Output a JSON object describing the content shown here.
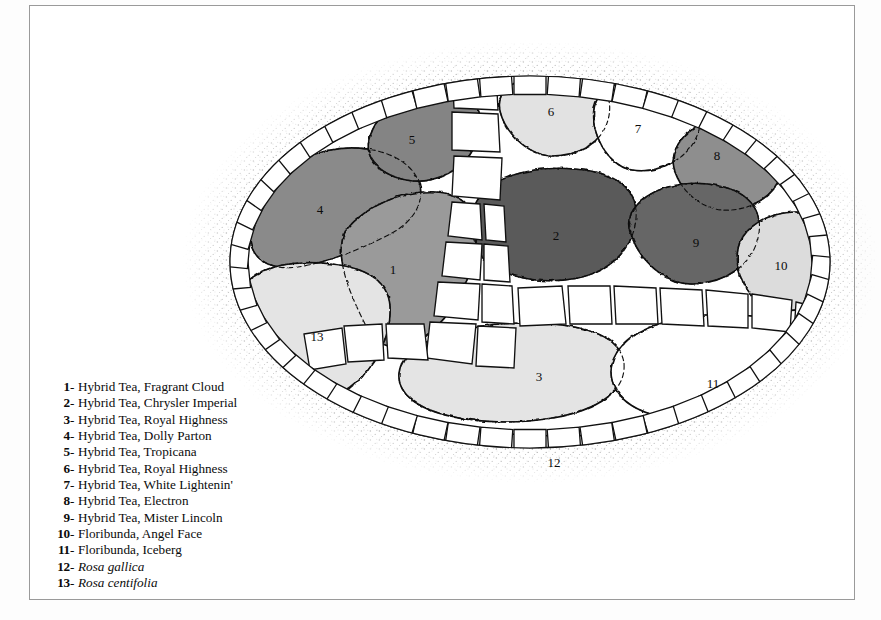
{
  "figure": {
    "kind": "garden-planting-plan",
    "shape": "oval bed with stone edging and flagstone path",
    "frame_color": "#9a9a9a",
    "background": "#ffffff"
  },
  "legend": {
    "name": "plant-key",
    "items": [
      {
        "num": "1",
        "dash": "-",
        "name": "Hybrid Tea, Fragrant Cloud",
        "italic": false,
        "fill": "#9a9a9a"
      },
      {
        "num": "2",
        "dash": "-",
        "name": "Hybrid Tea, Chrysler Imperial",
        "italic": false,
        "fill": "#5a5a5a"
      },
      {
        "num": "3",
        "dash": "-",
        "name": "Hybrid Tea, Royal Highness",
        "italic": false,
        "fill": "#e4e4e4"
      },
      {
        "num": "4",
        "dash": "-",
        "name": "Hybrid Tea, Dolly Parton",
        "italic": false,
        "fill": "#8a8a8a"
      },
      {
        "num": "5",
        "dash": "-",
        "name": "Hybrid Tea, Tropicana",
        "italic": false,
        "fill": "#848484"
      },
      {
        "num": "6",
        "dash": "-",
        "name": "Hybrid Tea, Royal Highness",
        "italic": false,
        "fill": "#e2e2e2"
      },
      {
        "num": "7",
        "dash": "-",
        "name": "Hybrid Tea, White Lightenin'",
        "italic": false,
        "fill": "#ffffff"
      },
      {
        "num": "8",
        "dash": "-",
        "name": "Hybrid Tea, Electron",
        "italic": false,
        "fill": "#8e8e8e"
      },
      {
        "num": "9",
        "dash": "-",
        "name": "Hybrid Tea, Mister Lincoln",
        "italic": false,
        "fill": "#666666"
      },
      {
        "num": "10",
        "dash": "-",
        "name": "Floribunda, Angel Face",
        "italic": false,
        "fill": "#dcdcdc"
      },
      {
        "num": "11",
        "dash": "-",
        "name": "Floribunda, Iceberg",
        "italic": false,
        "fill": "#ffffff"
      },
      {
        "num": "12",
        "dash": "-",
        "name": "Rosa gallica",
        "italic": true,
        "fill": "#e0e0e0"
      },
      {
        "num": "13",
        "dash": "-",
        "name": "Rosa centifolia",
        "italic": true,
        "fill": "#e4e4e4"
      }
    ]
  },
  "plan_labels": [
    {
      "num": "1",
      "x": 213,
      "y": 250
    },
    {
      "num": "2",
      "x": 376,
      "y": 216
    },
    {
      "num": "3",
      "x": 359,
      "y": 357
    },
    {
      "num": "4",
      "x": 140,
      "y": 190
    },
    {
      "num": "5",
      "x": 232,
      "y": 120
    },
    {
      "num": "6",
      "x": 371,
      "y": 92
    },
    {
      "num": "7",
      "x": 458,
      "y": 109
    },
    {
      "num": "8",
      "x": 537,
      "y": 136
    },
    {
      "num": "9",
      "x": 516,
      "y": 223
    },
    {
      "num": "10",
      "x": 601,
      "y": 246
    },
    {
      "num": "11",
      "x": 533,
      "y": 364
    },
    {
      "num": "12",
      "x": 374,
      "y": 443
    },
    {
      "num": "13",
      "x": 137,
      "y": 317
    }
  ]
}
